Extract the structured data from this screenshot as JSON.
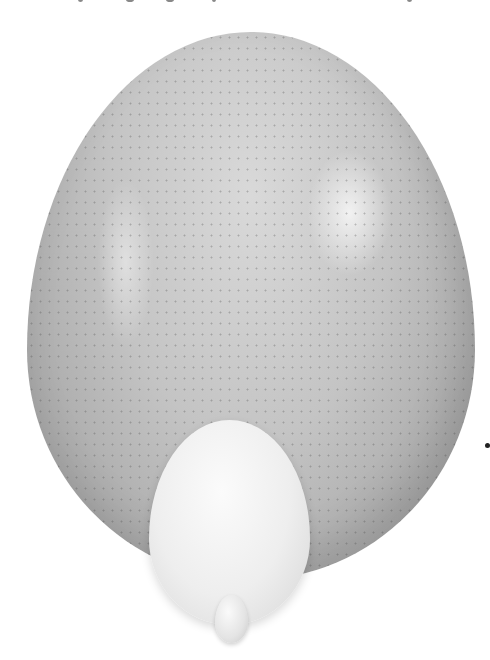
{
  "image": {
    "description": "Black-and-white photograph comparing egg sizes: a large speckled ostrich egg, a smooth white chicken egg in front, and a tiny egg at the bottom",
    "background_color": "#ffffff",
    "subjects": [
      {
        "name": "ostrich egg",
        "color": "#c4c4c4",
        "texture": "speckled pores"
      },
      {
        "name": "chicken egg",
        "color": "#eeeeee",
        "texture": "smooth"
      },
      {
        "name": "tiny egg",
        "color": "#e4e4e4",
        "texture": "smooth"
      }
    ],
    "marks": {
      "dot_color": "#222222"
    }
  }
}
